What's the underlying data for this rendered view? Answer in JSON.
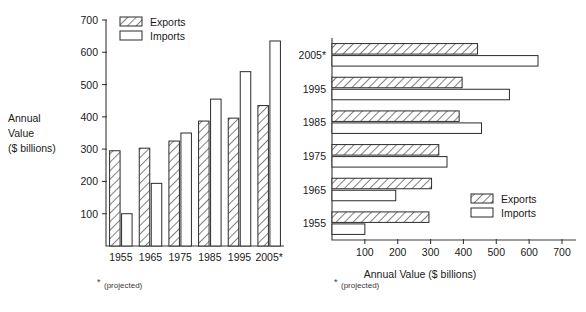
{
  "chart_data": [
    {
      "id": "vertical-grouped-bar",
      "type": "bar",
      "orientation": "vertical",
      "title": "",
      "xlabel": "",
      "ylabel": "Annual Value ($ billions)",
      "ylabel_lines": [
        "Annual",
        "Value",
        "($ billions)"
      ],
      "categories": [
        "1955",
        "1965",
        "1975",
        "1985",
        "1995",
        "2005*"
      ],
      "ylim": [
        0,
        700
      ],
      "yticks": [
        100,
        200,
        300,
        400,
        500,
        600,
        700
      ],
      "ytick_labels": [
        "100",
        "200",
        "300",
        "400",
        "500",
        "600",
        "700"
      ],
      "grid": false,
      "legend_position": "top-left",
      "series": [
        {
          "name": "Exports",
          "pattern": "hatched",
          "values": [
            295,
            303,
            325,
            387,
            396,
            435
          ]
        },
        {
          "name": "Imports",
          "pattern": "open",
          "values": [
            100,
            194,
            350,
            455,
            540,
            635
          ]
        }
      ],
      "footnote": "(projected)",
      "footnote_marker": "*"
    },
    {
      "id": "horizontal-grouped-bar",
      "type": "bar",
      "orientation": "horizontal",
      "title": "",
      "xlabel": "Annual Value ($ billions)",
      "ylabel": "",
      "categories": [
        "1955",
        "1965",
        "1975",
        "1985",
        "1995",
        "2005*"
      ],
      "xlim": [
        0,
        700
      ],
      "xticks": [
        100,
        200,
        300,
        400,
        500,
        600,
        700
      ],
      "xtick_labels": [
        "100",
        "200",
        "300",
        "400",
        "500",
        "600",
        "700"
      ],
      "grid": false,
      "legend_position": "bottom-right",
      "series": [
        {
          "name": "Exports",
          "pattern": "hatched",
          "values": [
            295,
            303,
            325,
            387,
            396,
            443
          ]
        },
        {
          "name": "Imports",
          "pattern": "open",
          "values": [
            100,
            194,
            350,
            455,
            540,
            627
          ]
        }
      ],
      "footnote": "(projected)",
      "footnote_marker": "*"
    }
  ],
  "legend": {
    "exports_label": "Exports",
    "imports_label": "Imports"
  },
  "colors": {
    "stroke": "#2b2b2b",
    "axis": "#3a3a3a",
    "background": "#ffffff",
    "text": "#1a1a1a"
  }
}
